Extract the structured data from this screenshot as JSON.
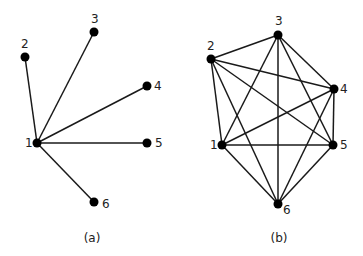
{
  "figures": [
    {
      "id": "a",
      "caption": "(a)",
      "caption_pos": [
        92,
        242
      ],
      "type": "star graph",
      "nodes": [
        {
          "id": "1",
          "label": "1",
          "x": 37,
          "y": 143,
          "lx": -12,
          "ly": 4
        },
        {
          "id": "2",
          "label": "2",
          "x": 25,
          "y": 57,
          "lx": -4,
          "ly": -9
        },
        {
          "id": "3",
          "label": "3",
          "x": 94,
          "y": 32,
          "lx": -3,
          "ly": -9
        },
        {
          "id": "4",
          "label": "4",
          "x": 147,
          "y": 86,
          "lx": 7,
          "ly": 4
        },
        {
          "id": "5",
          "label": "5",
          "x": 147,
          "y": 143,
          "lx": 8,
          "ly": 4
        },
        {
          "id": "6",
          "label": "6",
          "x": 94,
          "y": 202,
          "lx": 8,
          "ly": 6
        }
      ],
      "edges": [
        [
          "1",
          "2"
        ],
        [
          "1",
          "3"
        ],
        [
          "1",
          "4"
        ],
        [
          "1",
          "5"
        ],
        [
          "1",
          "6"
        ]
      ]
    },
    {
      "id": "b",
      "caption": "(b)",
      "caption_pos": [
        279,
        242
      ],
      "type": "complete graph K6",
      "nodes": [
        {
          "id": "1",
          "label": "1",
          "x": 222,
          "y": 145,
          "lx": -12,
          "ly": 4
        },
        {
          "id": "2",
          "label": "2",
          "x": 211,
          "y": 59,
          "lx": -4,
          "ly": -9
        },
        {
          "id": "3",
          "label": "3",
          "x": 278,
          "y": 35,
          "lx": -3,
          "ly": -10
        },
        {
          "id": "4",
          "label": "4",
          "x": 334,
          "y": 89,
          "lx": 6,
          "ly": 4
        },
        {
          "id": "5",
          "label": "5",
          "x": 333,
          "y": 145,
          "lx": 7,
          "ly": 4
        },
        {
          "id": "6",
          "label": "6",
          "x": 278,
          "y": 204,
          "lx": 5,
          "ly": 10
        }
      ],
      "edges": [
        [
          "1",
          "2"
        ],
        [
          "1",
          "3"
        ],
        [
          "1",
          "4"
        ],
        [
          "1",
          "5"
        ],
        [
          "1",
          "6"
        ],
        [
          "2",
          "3"
        ],
        [
          "2",
          "4"
        ],
        [
          "2",
          "5"
        ],
        [
          "2",
          "6"
        ],
        [
          "3",
          "4"
        ],
        [
          "3",
          "5"
        ],
        [
          "3",
          "6"
        ],
        [
          "4",
          "5"
        ],
        [
          "4",
          "6"
        ],
        [
          "5",
          "6"
        ]
      ]
    }
  ]
}
